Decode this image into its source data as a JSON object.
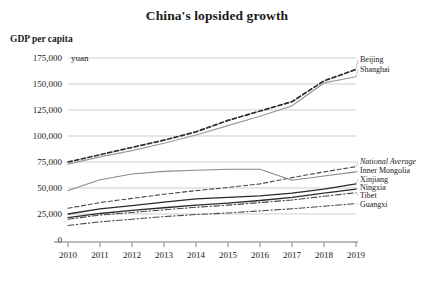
{
  "chart_data": {
    "type": "line",
    "title": "China's lopsided growth",
    "ylabel": "GDP per capita",
    "yunit": "yuan",
    "xlabel": "",
    "x": [
      2010,
      2011,
      2012,
      2013,
      2014,
      2015,
      2016,
      2017,
      2018,
      2019
    ],
    "xtick_labels": [
      "2010",
      "2011",
      "2012",
      "2013",
      "2014",
      "2015",
      "2016",
      "2017",
      "2018",
      "2019"
    ],
    "ytick_labels": [
      "0",
      "25,000",
      "50,000",
      "75,000",
      "100,000",
      "125,000",
      "150,000",
      "175,000"
    ],
    "ytick_values": [
      0,
      25000,
      50000,
      75000,
      100000,
      125000,
      150000,
      175000
    ],
    "ylim": [
      0,
      175000
    ],
    "xlim": [
      2010,
      2019
    ],
    "grid": "horizontal",
    "legend_position": "right-inline",
    "series": [
      {
        "name": "Beijing",
        "label": "Beijing",
        "style": "dashed",
        "color": "#2b2b2b",
        "width": 1.7,
        "label_y": 62,
        "values": [
          75000,
          82000,
          89000,
          96000,
          104000,
          115000,
          124000,
          133000,
          153000,
          164000
        ]
      },
      {
        "name": "Shanghai",
        "label": "Shanghai",
        "style": "solid",
        "color": "#9a9a9a",
        "width": 1.2,
        "label_y": 72,
        "values": [
          73000,
          80000,
          86000,
          93000,
          101000,
          110000,
          119000,
          129000,
          151000,
          157000
        ]
      },
      {
        "name": "National Average",
        "label": "National Average",
        "style": "dashed",
        "color": "#4a4a4a",
        "width": 1.1,
        "italic": true,
        "label_y": 164,
        "values": [
          30500,
          36000,
          40000,
          44000,
          47500,
          50500,
          54000,
          60000,
          65500,
          70500
        ]
      },
      {
        "name": "Inner Mongolia",
        "label": "Inner Mongolia",
        "style": "solid",
        "color": "#8a8a8a",
        "width": 1.1,
        "label_y": 173,
        "values": [
          47500,
          58000,
          63500,
          66000,
          67000,
          68000,
          68000,
          57500,
          61500,
          65500
        ]
      },
      {
        "name": "Xinjiang",
        "label": "Xinjiang",
        "style": "solid",
        "color": "#2b2b2b",
        "width": 1.3,
        "label_y": 182,
        "values": [
          25000,
          30000,
          33000,
          36500,
          39500,
          41000,
          42500,
          45000,
          49000,
          54000
        ]
      },
      {
        "name": "Ningxia",
        "label": "Ningxia",
        "style": "solid",
        "color": "#2b2b2b",
        "width": 1.3,
        "label_y": 190,
        "values": [
          21500,
          25500,
          28500,
          31000,
          33500,
          35500,
          38000,
          41000,
          45000,
          49000
        ]
      },
      {
        "name": "Tibet",
        "label": "Tibet",
        "style": "dashdot",
        "color": "#4a4a4a",
        "width": 1.1,
        "label_y": 198,
        "values": [
          20000,
          24000,
          26500,
          29000,
          31500,
          33500,
          36000,
          38500,
          42000,
          45500
        ]
      },
      {
        "name": "Guangxi",
        "label": "Guangxi",
        "style": "dashdot",
        "color": "#4a4a4a",
        "width": 1.1,
        "label_y": 207,
        "values": [
          14000,
          17500,
          20000,
          22500,
          24500,
          26000,
          28000,
          30000,
          32500,
          35000
        ]
      }
    ]
  }
}
